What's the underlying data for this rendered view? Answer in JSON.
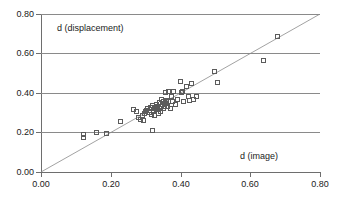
{
  "chart_data": {
    "type": "scatter",
    "title": "",
    "xlabel": "d (image)",
    "ylabel": "d (displacement)",
    "xlim": [
      0.0,
      0.8
    ],
    "ylim": [
      0.0,
      0.8
    ],
    "xticks": [
      "0.00",
      "0.20",
      "0.40",
      "0.60",
      "0.80"
    ],
    "yticks": [
      "0.00",
      "0.20",
      "0.40",
      "0.60",
      "0.80"
    ],
    "xtick_values": [
      0.0,
      0.2,
      0.4,
      0.6,
      0.8
    ],
    "ytick_values": [
      0.0,
      0.2,
      0.4,
      0.6,
      0.8
    ],
    "grid": "horizontal",
    "legend": "none",
    "marker": "open-square",
    "marker_color": "#5b5b5b",
    "gridline_color": "#8a8a8a",
    "axis_color": "#6e6e6e",
    "reference_line": {
      "label": "1:1 line",
      "type": "line",
      "from": [
        0.0,
        0.0
      ],
      "to": [
        0.8,
        0.8
      ],
      "style": "thin-solid",
      "color": "#8a8a8a"
    },
    "points": [
      [
        0.122,
        0.185
      ],
      [
        0.124,
        0.172
      ],
      [
        0.16,
        0.2
      ],
      [
        0.19,
        0.193
      ],
      [
        0.228,
        0.252
      ],
      [
        0.268,
        0.312
      ],
      [
        0.276,
        0.305
      ],
      [
        0.28,
        0.272
      ],
      [
        0.286,
        0.265
      ],
      [
        0.292,
        0.283
      ],
      [
        0.296,
        0.258
      ],
      [
        0.298,
        0.296
      ],
      [
        0.3,
        0.304
      ],
      [
        0.304,
        0.311
      ],
      [
        0.308,
        0.318
      ],
      [
        0.312,
        0.3
      ],
      [
        0.316,
        0.322
      ],
      [
        0.318,
        0.291
      ],
      [
        0.32,
        0.21
      ],
      [
        0.322,
        0.332
      ],
      [
        0.324,
        0.31
      ],
      [
        0.326,
        0.318
      ],
      [
        0.328,
        0.286
      ],
      [
        0.33,
        0.325
      ],
      [
        0.332,
        0.34
      ],
      [
        0.334,
        0.312
      ],
      [
        0.336,
        0.33
      ],
      [
        0.338,
        0.296
      ],
      [
        0.34,
        0.318
      ],
      [
        0.342,
        0.348
      ],
      [
        0.344,
        0.304
      ],
      [
        0.346,
        0.328
      ],
      [
        0.348,
        0.366
      ],
      [
        0.35,
        0.34
      ],
      [
        0.352,
        0.318
      ],
      [
        0.354,
        0.355
      ],
      [
        0.356,
        0.328
      ],
      [
        0.358,
        0.398
      ],
      [
        0.36,
        0.342
      ],
      [
        0.362,
        0.357
      ],
      [
        0.364,
        0.33
      ],
      [
        0.366,
        0.352
      ],
      [
        0.368,
        0.404
      ],
      [
        0.372,
        0.318
      ],
      [
        0.375,
        0.38
      ],
      [
        0.378,
        0.356
      ],
      [
        0.382,
        0.404
      ],
      [
        0.386,
        0.34
      ],
      [
        0.392,
        0.366
      ],
      [
        0.4,
        0.458
      ],
      [
        0.404,
        0.398
      ],
      [
        0.406,
        0.404
      ],
      [
        0.41,
        0.352
      ],
      [
        0.418,
        0.43
      ],
      [
        0.424,
        0.381
      ],
      [
        0.428,
        0.362
      ],
      [
        0.434,
        0.444
      ],
      [
        0.44,
        0.367
      ],
      [
        0.448,
        0.38
      ],
      [
        0.5,
        0.508
      ],
      [
        0.508,
        0.452
      ],
      [
        0.64,
        0.564
      ],
      [
        0.68,
        0.682
      ]
    ]
  }
}
